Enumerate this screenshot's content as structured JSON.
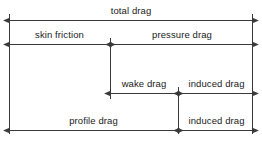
{
  "diagram": {
    "stroke_color": "#3a3a3a",
    "text_color": "#1a1a1a",
    "background": "#ffffff",
    "labels": {
      "total_drag": "total drag",
      "skin_friction": "skin friction",
      "pressure_drag": "pressure drag",
      "wake_drag": "wake drag",
      "induced_drag_upper": "induced drag",
      "profile_drag": "profile drag",
      "induced_drag_lower": "induced drag"
    },
    "rows": [
      {
        "name": "total-drag-row",
        "segments": [
          {
            "label": "total drag",
            "x1": 9,
            "x2": 252
          }
        ],
        "y": 20
      },
      {
        "name": "friction-pressure-row",
        "segments": [
          {
            "label": "skin friction",
            "x1": 9,
            "x2": 110
          },
          {
            "label": "pressure drag",
            "x1": 110,
            "x2": 252
          }
        ],
        "y": 44
      },
      {
        "name": "wake-induced-row",
        "segments": [
          {
            "label": "wake drag",
            "x1": 110,
            "x2": 178
          },
          {
            "label": "induced drag",
            "x1": 178,
            "x2": 252
          }
        ],
        "y": 93
      },
      {
        "name": "profile-induced-row",
        "segments": [
          {
            "label": "profile drag",
            "x1": 9,
            "x2": 178
          },
          {
            "label": "induced drag",
            "x1": 178,
            "x2": 252
          }
        ],
        "y": 130
      }
    ]
  }
}
